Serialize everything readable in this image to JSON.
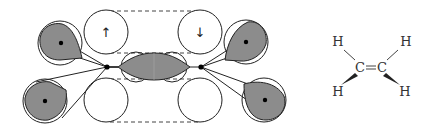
{
  "diagram": {
    "colors": {
      "line": "#222222",
      "lobe_fill": "#8c8c8c",
      "background": "#ffffff"
    },
    "orbital_diagram": {
      "p_orbitals": [
        {
          "position": "top-left",
          "spin_arrow": "↑"
        },
        {
          "position": "top-right",
          "spin_arrow": "↓"
        },
        {
          "position": "bottom-left",
          "spin_arrow": ""
        },
        {
          "position": "bottom-right",
          "spin_arrow": ""
        }
      ],
      "sp2_lobes": [
        "upper-left",
        "lower-left",
        "upper-right",
        "lower-right",
        "center-sigma"
      ]
    },
    "molecule": {
      "name": "ethylene",
      "atoms": {
        "c1": "C",
        "c2": "C",
        "h_top_left": "H",
        "h_top_right": "H",
        "h_bottom_left": "H",
        "h_bottom_right": "H"
      },
      "bond": "="
    }
  }
}
